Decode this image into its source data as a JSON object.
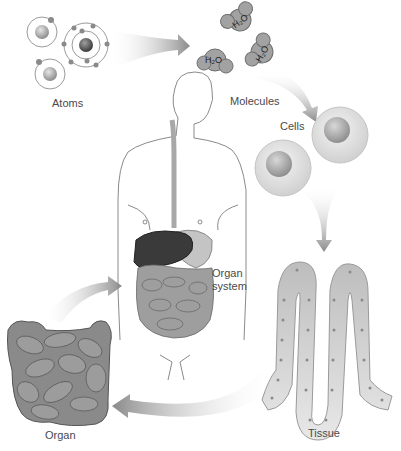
{
  "diagram": {
    "labels": {
      "atoms": "Atoms",
      "molecules": "Molecules",
      "cells": "Cells",
      "tissue": "Tissue",
      "organ": "Organ",
      "organ_system": "Organ\nsystem"
    },
    "molecule_formula": "H2O",
    "colors": {
      "arrow": "#8a8a8a",
      "liver": "#3a3a3a",
      "organ": "#7a7a7a",
      "cell": "#e2e2e2",
      "nucleus": "#a8a8a8",
      "molecule": "#9a9a9a",
      "text": "#4a4a4a"
    },
    "flow": [
      "Atoms",
      "Molecules",
      "Cells",
      "Tissue",
      "Organ",
      "Organ system"
    ]
  }
}
